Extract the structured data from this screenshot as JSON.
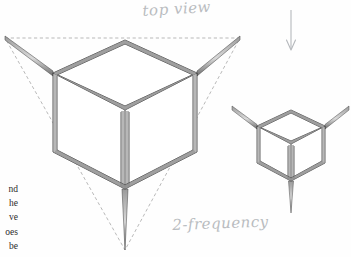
{
  "page": {
    "background_color": "#fefefe",
    "ink_color": "#3a3a3a",
    "dashed_color": "#8d8d8d",
    "pencil_label_color": "#b9bcc0",
    "shade_color": "#777777"
  },
  "labels": {
    "top_view": "top view",
    "frequency": "2-frequency"
  },
  "arrow": {
    "name": "downward-arrow",
    "direction": "down",
    "x": 291,
    "y_start": 10,
    "y_end": 50
  },
  "body_text_fragment": {
    "lines": [
      "nd",
      "he",
      "ve",
      "oes",
      "be"
    ]
  },
  "figures": {
    "large_cube": {
      "name": "large-strut-cube",
      "caption": "top view",
      "top_face": [
        [
          125,
          40
        ],
        [
          53,
          73
        ],
        [
          125,
          110
        ],
        [
          197,
          73
        ]
      ],
      "bottom_face": [
        [
          125,
          119
        ],
        [
          53,
          152
        ],
        [
          125,
          189
        ],
        [
          197,
          152
        ]
      ],
      "struts": [
        {
          "from": [
            53,
            73
          ],
          "to": [
            5,
            38
          ]
        },
        {
          "from": [
            197,
            73
          ],
          "to": [
            240,
            38
          ]
        },
        {
          "from": [
            125,
            40
          ],
          "to": [
            125,
            40
          ]
        },
        {
          "from": [
            125,
            189
          ],
          "to": [
            125,
            250
          ]
        }
      ]
    },
    "small_cube": {
      "name": "small-strut-cube",
      "caption": "2-frequency",
      "top_face": [
        [
          291,
          110
        ],
        [
          257,
          126
        ],
        [
          291,
          144
        ],
        [
          325,
          126
        ]
      ],
      "bottom_face": [
        [
          291,
          147
        ],
        [
          257,
          163
        ],
        [
          291,
          181
        ],
        [
          325,
          163
        ]
      ],
      "struts": [
        {
          "from": [
            257,
            126
          ],
          "to": [
            232,
            108
          ]
        },
        {
          "from": [
            325,
            126
          ],
          "to": [
            348,
            108
          ]
        },
        {
          "from": [
            291,
            181
          ],
          "to": [
            291,
            212
          ]
        }
      ]
    },
    "dashed_triangle": {
      "name": "dashed-construction-triangle",
      "vertices": [
        [
          5,
          38
        ],
        [
          240,
          38
        ],
        [
          125,
          250
        ]
      ]
    }
  }
}
